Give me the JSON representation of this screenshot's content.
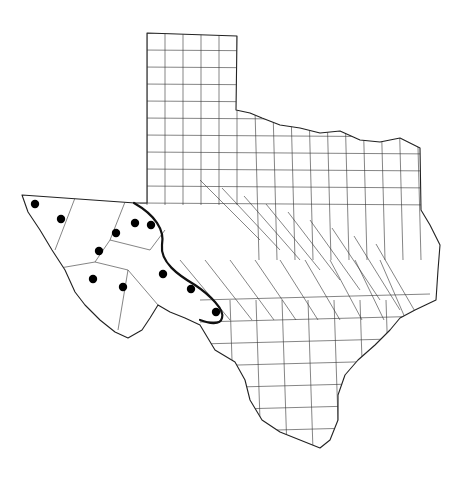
{
  "map": {
    "subject": "Texas county distribution map",
    "background_color": "#ffffff",
    "line_color": "#333333",
    "marker_color": "#000000",
    "state_outline": "M147,33 L237,36 L236,110 L250,113 L262,118 L280,125 L300,128 L320,133 L340,131 L360,140 L380,142 L400,138 L420,148 L421,210 L430,225 L440,245 L438,270 L436,300 L415,310 L400,318 L390,330 L375,345 L358,360 L345,375 L338,395 L338,420 L330,440 L320,448 L300,440 L280,432 L262,420 L250,400 L245,380 L235,362 L215,350 L200,325 L185,318 L170,312 L158,305 L150,318 L142,330 L128,338 L115,332 L100,320 L85,305 L75,292 L65,270 L52,250 L40,230 L28,212 L22,195 L135,203 L147,203 Z",
    "markers": [
      {
        "x": 35,
        "y": 204
      },
      {
        "x": 61,
        "y": 219
      },
      {
        "x": 116,
        "y": 233
      },
      {
        "x": 135,
        "y": 223
      },
      {
        "x": 151,
        "y": 225
      },
      {
        "x": 99,
        "y": 251
      },
      {
        "x": 93,
        "y": 279
      },
      {
        "x": 123,
        "y": 287
      },
      {
        "x": 163,
        "y": 274
      },
      {
        "x": 191,
        "y": 289
      },
      {
        "x": 216,
        "y": 312
      }
    ],
    "range_boundary": "M134,203 C155,215 165,230 162,245 C160,262 178,275 195,285 C210,295 225,310 222,318 C220,326 208,323 200,320"
  }
}
